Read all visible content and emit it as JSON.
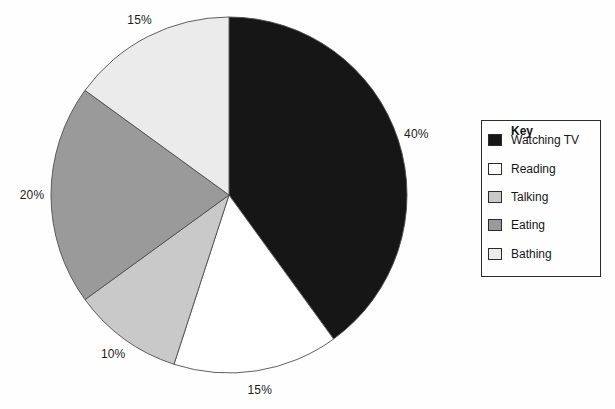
{
  "chart_data": {
    "type": "pie",
    "title": "",
    "start_angle_deg": 0,
    "direction": "clockwise",
    "legend": {
      "title": "Key",
      "position": "right"
    },
    "slices": [
      {
        "label": "Watching TV",
        "value": 40,
        "pct_label": "40%",
        "color": "#161616"
      },
      {
        "label": "Reading",
        "value": 15,
        "pct_label": "15%",
        "color": "#ffffff"
      },
      {
        "label": "Talking",
        "value": 10,
        "pct_label": "10%",
        "color": "#c9c9c9"
      },
      {
        "label": "Eating",
        "value": 20,
        "pct_label": "20%",
        "color": "#9a9a9a"
      },
      {
        "label": "Bathing",
        "value": 15,
        "pct_label": "15%",
        "color": "#ebebeb"
      }
    ]
  }
}
